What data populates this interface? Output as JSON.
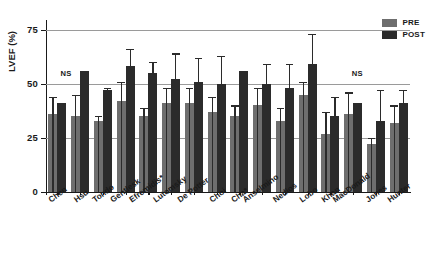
{
  "chart_data": {
    "type": "bar",
    "title": "",
    "xlabel": "",
    "ylabel": "LVEF (%)",
    "ylim": [
      0,
      78
    ],
    "yticks": [
      0,
      25,
      50,
      75
    ],
    "grid": "horizontal",
    "legend_position": "top-right",
    "categories": [
      "Chen",
      "Hsu",
      "Tondo",
      "Gentlesk",
      "Efremidis*",
      "Lutomsky",
      "De Potter",
      "Choi",
      "Cha*",
      "Anselmino",
      "Nedios",
      "Lobo",
      "Khan",
      "MacDonald",
      "Jones",
      "Hunter"
    ],
    "series": [
      {
        "name": "PRE",
        "color": "#6e6e6e",
        "values": [
          36,
          35,
          33,
          42,
          35,
          41,
          41,
          37,
          35,
          40,
          33,
          45,
          27,
          36,
          22,
          32
        ],
        "error_upper": [
          44,
          45,
          35,
          51,
          39,
          48,
          48,
          44,
          40,
          48,
          39,
          51,
          37,
          46,
          25,
          40
        ]
      },
      {
        "name": "POST",
        "color": "#2b2b2b",
        "values": [
          41,
          56,
          47,
          58,
          55,
          52,
          51,
          50,
          56,
          50,
          48,
          59,
          35,
          41,
          33,
          41
        ],
        "error_upper": [
          41,
          56,
          48,
          66,
          60,
          64,
          62,
          63,
          56,
          59,
          59,
          73,
          44,
          41,
          47,
          47
        ]
      }
    ],
    "annotations": [
      {
        "text": "NS",
        "x_pct": 4.0,
        "y_value": 52.5
      },
      {
        "text": "NS",
        "x_pct": 84.0,
        "y_value": 52.5
      }
    ]
  },
  "legend": {
    "items": [
      {
        "label": "PRE",
        "color": "#6e6e6e"
      },
      {
        "label": "POST",
        "color": "#2b2b2b"
      }
    ]
  },
  "axis": {
    "y_tick_labels": [
      "75",
      "50",
      "25",
      "0"
    ],
    "y_axis_title": "LVEF (%)"
  }
}
